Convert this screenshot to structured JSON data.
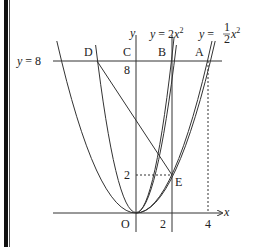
{
  "diagram": {
    "type": "coordinate-geometry",
    "axes": {
      "x_label": "x",
      "y_label": "y",
      "origin_label": "O"
    },
    "curves": [
      {
        "name": "y = 2x^2",
        "label_prefix": "y = 2x",
        "label_sup": "2",
        "a": 2
      },
      {
        "name": "y = 1/2 x^2",
        "label_prefix": "y = ",
        "label_frac_num": "1",
        "label_frac_den": "2",
        "label_var": "x",
        "label_sup": "2",
        "a": 0.5
      }
    ],
    "horizontal_line": {
      "label": "y = 8",
      "y": 8
    },
    "points": [
      {
        "name": "A",
        "x": 4,
        "y": 8
      },
      {
        "name": "B",
        "x": 2,
        "y": 8
      },
      {
        "name": "C",
        "x": 0,
        "y": 8
      },
      {
        "name": "D",
        "x": -2,
        "y": 8
      },
      {
        "name": "E",
        "x": 2,
        "y": 2
      },
      {
        "name": "O",
        "x": 0,
        "y": 0
      }
    ],
    "tick_labels": {
      "x": [
        "2",
        "4"
      ],
      "y": [
        "2",
        "8"
      ]
    },
    "segments": [
      "D-E",
      "x=2 vertical line",
      "E to y-axis dashed",
      "A to x-axis dashed"
    ]
  }
}
